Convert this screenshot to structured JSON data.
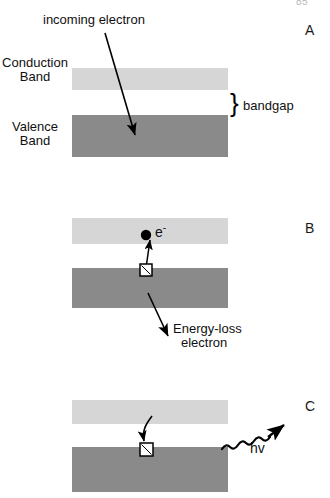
{
  "figure": {
    "page_number": "85",
    "background_color": "#ffffff",
    "width": 330,
    "height": 498
  },
  "colors": {
    "conduction_band": "#d6d6d6",
    "valence_band": "#8a8a8a",
    "stroke": "#000000",
    "text": "#101010"
  },
  "panels": [
    {
      "letter": "A",
      "labels": {
        "incoming_electron": "incoming electron",
        "conduction_band_line1": "Conduction",
        "conduction_band_line2": "Band",
        "valence_band_line1": "Valence",
        "valence_band_line2": "Band",
        "bandgap": "bandgap",
        "bracket": "}"
      }
    },
    {
      "letter": "B",
      "labels": {
        "electron_symbol": "e",
        "electron_charge": "-",
        "energy_loss_line1": "Energy-loss",
        "energy_loss_line2": "electron"
      }
    },
    {
      "letter": "C",
      "labels": {
        "photon": "hv"
      }
    }
  ]
}
